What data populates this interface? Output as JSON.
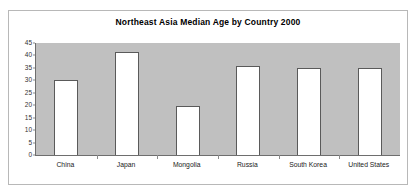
{
  "chart_data": {
    "type": "bar",
    "title": "Northeast Asia Median Age by Country 2000",
    "xlabel": "",
    "ylabel": "",
    "categories": [
      "China",
      "Japan",
      "Mongolia",
      "Russia",
      "South Korea",
      "United States"
    ],
    "values": [
      30.0,
      41.2,
      19.7,
      35.6,
      35.0,
      34.8
    ],
    "ylim": [
      0,
      45
    ],
    "ytick_step": 5,
    "yticks": [
      45,
      40,
      35,
      30,
      25,
      20,
      15,
      10,
      5,
      0
    ],
    "ytick_labels": [
      "45",
      "40",
      "35",
      "30",
      "25",
      "20",
      "15",
      "10",
      "5",
      "0"
    ],
    "grid": false,
    "legend": false,
    "legend_position": "none",
    "series": [
      {
        "name": "Median Age",
        "values": [
          30.0,
          41.2,
          19.7,
          35.6,
          35.0,
          34.8
        ]
      }
    ],
    "colors": {
      "plot_background": "#c0c0c0",
      "bar_fill": "#ffffff",
      "bar_border": "#5a5a5a",
      "axis": "#6e6e6e",
      "text": "#000000",
      "frame_border": "#b8b8b8",
      "page_background": "#ffffff"
    }
  }
}
